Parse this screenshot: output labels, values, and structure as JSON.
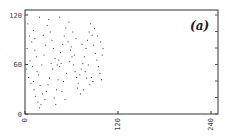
{
  "chart_data": {
    "type": "scatter",
    "title": "",
    "panel_label": "(a)",
    "xlabel": "",
    "ylabel": "",
    "xlim": [
      0,
      250
    ],
    "ylim": [
      0,
      125
    ],
    "x_ticks": [
      0,
      120,
      240
    ],
    "y_ticks": [
      0,
      60,
      120
    ],
    "x_tick_labels": [
      "0",
      "120",
      "240"
    ],
    "y_tick_labels": [
      "0",
      "60",
      "120"
    ],
    "grid": false,
    "legend": null,
    "point_color": "#333333",
    "points": [
      [
        3,
        110
      ],
      [
        5,
        95
      ],
      [
        8,
        88
      ],
      [
        10,
        102
      ],
      [
        12,
        78
      ],
      [
        14,
        70
      ],
      [
        6,
        65
      ],
      [
        9,
        58
      ],
      [
        15,
        52
      ],
      [
        4,
        45
      ],
      [
        7,
        38
      ],
      [
        11,
        30
      ],
      [
        13,
        22
      ],
      [
        16,
        15
      ],
      [
        18,
        8
      ],
      [
        20,
        12
      ],
      [
        22,
        25
      ],
      [
        19,
        35
      ],
      [
        17,
        48
      ],
      [
        21,
        60
      ],
      [
        24,
        72
      ],
      [
        26,
        84
      ],
      [
        23,
        96
      ],
      [
        28,
        108
      ],
      [
        30,
        115
      ],
      [
        32,
        100
      ],
      [
        34,
        90
      ],
      [
        36,
        80
      ],
      [
        38,
        68
      ],
      [
        33,
        62
      ],
      [
        35,
        55
      ],
      [
        31,
        44
      ],
      [
        29,
        36
      ],
      [
        27,
        28
      ],
      [
        25,
        18
      ],
      [
        37,
        20
      ],
      [
        40,
        30
      ],
      [
        42,
        42
      ],
      [
        44,
        58
      ],
      [
        46,
        62
      ],
      [
        43,
        66
      ],
      [
        41,
        60
      ],
      [
        45,
        75
      ],
      [
        48,
        85
      ],
      [
        50,
        95
      ],
      [
        52,
        105
      ],
      [
        55,
        88
      ],
      [
        58,
        78
      ],
      [
        60,
        70
      ],
      [
        62,
        60
      ],
      [
        64,
        52
      ],
      [
        66,
        45
      ],
      [
        68,
        38
      ],
      [
        70,
        48
      ],
      [
        72,
        55
      ],
      [
        74,
        62
      ],
      [
        76,
        70
      ],
      [
        78,
        80
      ],
      [
        80,
        90
      ],
      [
        82,
        100
      ],
      [
        84,
        110
      ],
      [
        86,
        96
      ],
      [
        88,
        84
      ],
      [
        90,
        74
      ],
      [
        92,
        66
      ],
      [
        94,
        58
      ],
      [
        96,
        50
      ],
      [
        98,
        42
      ],
      [
        85,
        45
      ],
      [
        87,
        40
      ],
      [
        83,
        36
      ],
      [
        79,
        44
      ],
      [
        75,
        30
      ],
      [
        71,
        25
      ],
      [
        67,
        32
      ],
      [
        63,
        72
      ],
      [
        59,
        82
      ],
      [
        57,
        64
      ],
      [
        53,
        50
      ],
      [
        49,
        40
      ],
      [
        47,
        28
      ],
      [
        39,
        12
      ],
      [
        51,
        18
      ],
      [
        99,
        72
      ],
      [
        100,
        80
      ],
      [
        97,
        88
      ],
      [
        93,
        95
      ],
      [
        89,
        104
      ],
      [
        81,
        60
      ],
      [
        77,
        52
      ],
      [
        73,
        85
      ],
      [
        65,
        92
      ],
      [
        61,
        100
      ],
      [
        56,
        112
      ],
      [
        44,
        118
      ],
      [
        18,
        118
      ],
      [
        12,
        92
      ],
      [
        2,
        80
      ],
      [
        1,
        55
      ],
      [
        10,
        40
      ]
    ]
  }
}
